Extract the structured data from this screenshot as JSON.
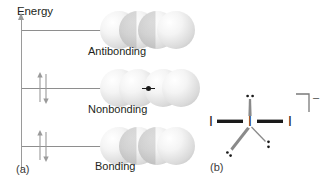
{
  "figure": {
    "caption_a": "(a)",
    "caption_b": "(b)"
  },
  "panel_a": {
    "axis_label": "Energy",
    "axis_icon": "up-arrow-icon",
    "levels": [
      {
        "id": "antibonding",
        "label": "Antibonding",
        "electrons": 0,
        "sphere_count": 4,
        "phase_pattern": "alternating",
        "y": 30
      },
      {
        "id": "nonbonding",
        "label": "Nonbonding",
        "electrons": 2,
        "sphere_count": 4,
        "phase_pattern": "node-center",
        "y": 88
      },
      {
        "id": "bonding",
        "label": "Bonding",
        "electrons": 2,
        "sphere_count": 4,
        "phase_pattern": "in-phase",
        "y": 146
      }
    ],
    "electron_arrow_up": "↑",
    "electron_arrow_down": "↓"
  },
  "panel_b": {
    "structure_name": "triiodide-lewis-structure",
    "center_atom": "I",
    "left_atom": "I",
    "right_atom": "I",
    "charge": "–",
    "bracket": "]",
    "lone_pair_count": 3
  },
  "colors": {
    "ink": "#231f20",
    "axis": "#9a9a9a",
    "level_line": "#8e8e8e",
    "bond": "#1a1a1a",
    "sphere_light": "#ffffff",
    "sphere_shade": "#c6c6c6",
    "background": "#ffffff"
  }
}
